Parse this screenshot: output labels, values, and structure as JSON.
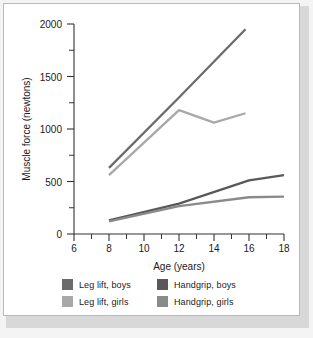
{
  "chart_data": {
    "type": "line",
    "title": "",
    "xlabel": "Age (years)",
    "ylabel": "Muscle force (newtons)",
    "xlim": [
      6,
      18
    ],
    "ylim": [
      0,
      2000
    ],
    "xticks": [
      6,
      8,
      10,
      12,
      14,
      16,
      18
    ],
    "yticks": [
      0,
      500,
      1000,
      1500,
      2000
    ],
    "x_minor_ticks": [
      7,
      9,
      11,
      13,
      15,
      17
    ],
    "y_minor_ticks": [
      250,
      750,
      1250,
      1750
    ],
    "grid": false,
    "legend_position": "below",
    "series": [
      {
        "name": "Leg lift, boys",
        "color": "#6b6b6b",
        "x": [
          8,
          12,
          15.8
        ],
        "values": [
          630,
          1300,
          1950
        ]
      },
      {
        "name": "Leg lift, girls",
        "color": "#a8a8a8",
        "x": [
          8,
          12,
          14,
          15.8
        ],
        "values": [
          560,
          1180,
          1060,
          1150
        ]
      },
      {
        "name": "Handgrip, boys",
        "color": "#595959",
        "x": [
          8,
          12,
          16,
          18
        ],
        "values": [
          130,
          290,
          510,
          560
        ]
      },
      {
        "name": "Handgrip, girls",
        "color": "#8a8a8a",
        "x": [
          8,
          12,
          16,
          18
        ],
        "values": [
          120,
          265,
          350,
          355
        ]
      }
    ]
  },
  "legend": {
    "rows": [
      {
        "left": {
          "label": "Leg lift, boys",
          "color": "#6b6b6b"
        },
        "right": {
          "label": "Handgrip, boys",
          "color": "#595959"
        }
      },
      {
        "left": {
          "label": "Leg lift, girls",
          "color": "#a8a8a8"
        },
        "right": {
          "label": "Handgrip, girls",
          "color": "#8a8a8a"
        }
      }
    ]
  },
  "axes": {
    "y_tick_labels": [
      "0",
      "500",
      "1000",
      "1500",
      "2000"
    ],
    "x_tick_labels": [
      "6",
      "8",
      "10",
      "12",
      "14",
      "16",
      "18"
    ],
    "x_title": "Age (years)",
    "y_title": "Muscle force (newtons)"
  },
  "colors": {
    "axis": "#333333",
    "text": "#1a1a1a",
    "frame": "#b9b9b9",
    "page_background": "#f4f4f4",
    "plot_background": "#ffffff"
  }
}
